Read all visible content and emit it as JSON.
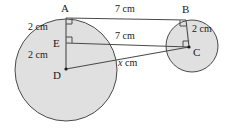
{
  "figure": {
    "stroke_color": "#4a4a4a",
    "fill_color": "#e0e0e0",
    "text_color": "#1a1a1a"
  },
  "points": [
    {
      "id": "A",
      "label": "A",
      "x": 66,
      "y": 18,
      "label_x": 61,
      "label_y": 3
    },
    {
      "id": "B",
      "label": "B",
      "x": 186,
      "y": 20,
      "label_x": 182,
      "label_y": 4
    },
    {
      "id": "C",
      "label": "C",
      "x": 189,
      "y": 47,
      "label_x": 193,
      "label_y": 47
    },
    {
      "id": "D",
      "label": "D",
      "x": 66,
      "y": 69,
      "label_x": 53,
      "label_y": 70
    },
    {
      "id": "E",
      "label": "E",
      "x": 66,
      "y": 43,
      "label_x": 53,
      "label_y": 38
    }
  ],
  "circles": [
    {
      "id": "large-circle",
      "cx": 66,
      "cy": 70,
      "r": 51
    },
    {
      "id": "small-circle",
      "cx": 192,
      "cy": 46,
      "r": 26
    }
  ],
  "segments": [
    {
      "id": "AB",
      "from": "A",
      "to": "B",
      "x1": 66,
      "y1": 18,
      "x2": 186,
      "y2": 20
    },
    {
      "id": "EC",
      "from": "E",
      "to": "C",
      "x1": 66,
      "y1": 43,
      "x2": 189,
      "y2": 47
    },
    {
      "id": "DC",
      "from": "D",
      "to": "C",
      "x1": 66,
      "y1": 69,
      "x2": 189,
      "y2": 47
    },
    {
      "id": "AD",
      "from": "A",
      "to": "D",
      "x1": 66,
      "y1": 18,
      "x2": 66,
      "y2": 69
    },
    {
      "id": "BC",
      "from": "B",
      "to": "C",
      "x1": 186,
      "y1": 20,
      "x2": 189,
      "y2": 47
    }
  ],
  "right_angle_marks": [
    {
      "id": "angle-at-A",
      "x": 66,
      "y": 18
    },
    {
      "id": "angle-at-E",
      "x": 66,
      "y": 43
    },
    {
      "id": "angle-at-B",
      "x": 186,
      "y": 20
    },
    {
      "id": "angle-at-C",
      "x": 189,
      "y": 47
    }
  ],
  "measurements": {
    "top": {
      "id": "AB-length",
      "text": "7 cm",
      "x": 115,
      "y": 4
    },
    "middle": {
      "id": "EC-length",
      "text": "7 cm",
      "x": 115,
      "y": 31
    },
    "diagonal": {
      "id": "DC-length",
      "text": "cm",
      "symbol": "x",
      "x": 120,
      "y": 58
    },
    "left_upper": {
      "id": "AE-length",
      "text": "2 cm",
      "x": 28,
      "y": 22
    },
    "left_lower": {
      "id": "ED-length",
      "text": "2 cm",
      "x": 28,
      "y": 50
    },
    "right": {
      "id": "BC-length",
      "text": "2 cm",
      "x": 192,
      "y": 24
    }
  }
}
